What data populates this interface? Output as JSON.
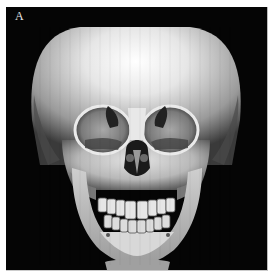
{
  "figure": {
    "panel_label": "A",
    "background_color": "#050505",
    "bone_color": "#d8d8d8"
  }
}
